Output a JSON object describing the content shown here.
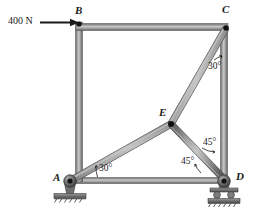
{
  "figure": {
    "type": "statics-frame-diagram",
    "background_color": "#ffffff",
    "member_color": "#8c8c8c",
    "member_edge_color": "#5a5a5a",
    "member_highlight_color": "#bdbdbd",
    "ink_color": "#1a1a1a"
  },
  "load": {
    "label": "400 N",
    "applied_at": "B",
    "direction": "horizontal-right",
    "arrow_start_x": 40,
    "arrow_end_x": 79,
    "arrow_y": 22
  },
  "joints": [
    {
      "id": "A",
      "label": "A",
      "x": 70,
      "y": 181,
      "support": "pin",
      "label_x": 53,
      "label_y": 175
    },
    {
      "id": "B",
      "label": "B",
      "x": 79,
      "y": 22,
      "support": "none",
      "label_x": 75,
      "label_y": 7
    },
    {
      "id": "C",
      "label": "C",
      "x": 227,
      "y": 27,
      "support": "none",
      "label_x": 222,
      "label_y": 6
    },
    {
      "id": "D",
      "label": "D",
      "x": 224,
      "y": 181,
      "support": "roller",
      "label_x": 235,
      "label_y": 174
    },
    {
      "id": "E",
      "label": "E",
      "x": 171,
      "y": 124,
      "support": "none",
      "label_x": 160,
      "label_y": 110
    }
  ],
  "members": [
    {
      "name": "AB",
      "from": "A",
      "to": "B",
      "thickness": 7
    },
    {
      "name": "BC",
      "from": "B",
      "to": "C",
      "thickness": 7
    },
    {
      "name": "CD",
      "from": "C",
      "to": "D",
      "thickness": 7
    },
    {
      "name": "AD",
      "from": "A",
      "to": "D",
      "thickness": 6
    },
    {
      "name": "AE",
      "from": "A",
      "to": "E",
      "thickness": 6
    },
    {
      "name": "EC",
      "from": "E",
      "to": "C",
      "thickness": 6
    },
    {
      "name": "ED",
      "from": "E",
      "to": "D",
      "thickness": 6
    }
  ],
  "angles": [
    {
      "id": "angle-c",
      "label": "30°",
      "at_joint": "C",
      "between": "CD and CE",
      "label_x": 208,
      "label_y": 62
    },
    {
      "id": "angle-a",
      "label": "30°",
      "at_joint": "A",
      "between": "AD and AE",
      "label_x": 98,
      "label_y": 165
    },
    {
      "id": "angle-e-upper",
      "label": "45°",
      "at_joint": "D-upper",
      "between": "DE and DC",
      "label_x": 203,
      "label_y": 139
    },
    {
      "id": "angle-d-lower",
      "label": "45°",
      "at_joint": "D",
      "between": "DE and DA",
      "label_x": 182,
      "label_y": 158
    }
  ],
  "supports": {
    "pin": {
      "at": "A",
      "description": "pin support with hatched base plate"
    },
    "roller": {
      "at": "D",
      "description": "roller support with two wheels and hatched base plate"
    }
  }
}
